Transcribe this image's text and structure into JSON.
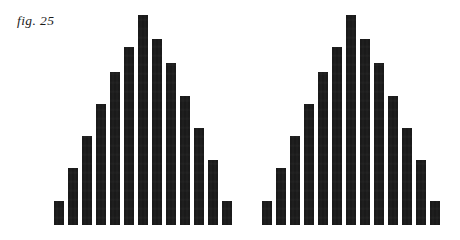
{
  "figure": {
    "label": "fig. 25",
    "background_color": "#ffffff",
    "ink_color": "#1a1a1a",
    "width": 460,
    "height": 240
  },
  "chart_data": [
    {
      "type": "bar",
      "name": "left-histogram",
      "title": "fig. 25",
      "xlabel": "",
      "ylabel": "",
      "grid": false,
      "legend": null,
      "axis_visible": false,
      "ylim": [
        0,
        13
      ],
      "categories": [
        "1",
        "2",
        "3",
        "4",
        "5",
        "6",
        "7",
        "8",
        "9",
        "10",
        "11",
        "12",
        "13"
      ],
      "values": [
        1.5,
        3.5,
        5.5,
        7.5,
        9.5,
        11,
        13,
        11.5,
        10,
        8,
        6,
        4,
        1.5
      ],
      "bar_width_px": 10,
      "bar_gap_px": 4,
      "baseline_y_px": 225,
      "peak_index": 6,
      "shape": "symmetric bell / normal distribution"
    },
    {
      "type": "bar",
      "name": "right-histogram",
      "title": "",
      "xlabel": "",
      "ylabel": "",
      "grid": false,
      "legend": null,
      "axis_visible": false,
      "ylim": [
        0,
        13
      ],
      "categories": [
        "1",
        "2",
        "3",
        "4",
        "5",
        "6",
        "7",
        "8",
        "9",
        "10",
        "11",
        "12",
        "13"
      ],
      "values": [
        1.5,
        3.5,
        5.5,
        7.5,
        9.5,
        11,
        13,
        11.5,
        10,
        8,
        6,
        4,
        1.5
      ],
      "bar_width_px": 10,
      "bar_gap_px": 4,
      "baseline_y_px": 225,
      "peak_index": 6,
      "shape": "symmetric bell / normal distribution"
    }
  ]
}
